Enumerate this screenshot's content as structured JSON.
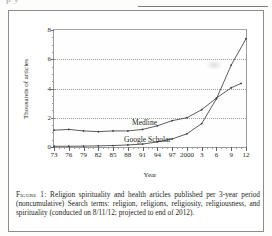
{
  "page": {
    "top_cut_text": "p    y",
    "caption_label": "Figure 1:",
    "caption_text": "Religion spirituality and health articles published per 3-year period (noncumulative) Search terms: religion, religions, religiosity, religiousness, and spirituality (conducted on 8/11/12; projected to end of 2012)."
  },
  "chart_data": {
    "type": "line",
    "title": "",
    "xlabel": "Year",
    "ylabel": "Thousands of articles",
    "xlim": [
      1973,
      2012
    ],
    "ylim": [
      0,
      8
    ],
    "yticks": [
      0,
      2,
      4,
      6,
      8
    ],
    "ytick_labels": [
      "0",
      "2",
      "4",
      "6",
      "8"
    ],
    "xticks": [
      1973,
      1976,
      1979,
      1982,
      1985,
      1988,
      1991,
      1994,
      1997,
      2000,
      2003,
      2006,
      2009,
      2012
    ],
    "xtick_labels": [
      "73",
      "76",
      "79",
      "82",
      "85",
      "88",
      "91",
      "94",
      "97",
      "2000",
      "3",
      "6",
      "9",
      "12"
    ],
    "grid": "horizontal-dotted",
    "legend_position": "inline-annotations",
    "series": [
      {
        "name": "Medline",
        "label_x": 1988,
        "label_y": 1.55,
        "x": [
          1973,
          1976,
          1979,
          1982,
          1985,
          1988,
          1991,
          1994,
          1997,
          2000,
          2003,
          2006,
          2009,
          2011
        ],
        "values": [
          1.15,
          1.2,
          1.1,
          1.05,
          1.1,
          1.1,
          1.2,
          1.45,
          1.8,
          2.0,
          2.55,
          3.35,
          4.05,
          4.35
        ]
      },
      {
        "name": "Google Scholar",
        "label_x": 1986,
        "label_y": 0.9,
        "x": [
          1973,
          1976,
          1979,
          1982,
          1985,
          1988,
          1991,
          1994,
          1997,
          2000,
          2003,
          2006,
          2009,
          2012
        ],
        "values": [
          0.05,
          0.05,
          0.06,
          0.08,
          0.1,
          0.14,
          0.2,
          0.35,
          0.55,
          0.9,
          1.6,
          3.3,
          5.6,
          7.4
        ]
      }
    ]
  }
}
